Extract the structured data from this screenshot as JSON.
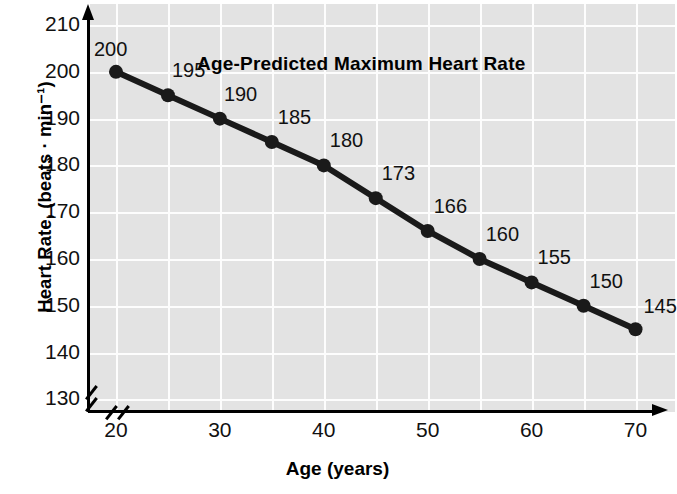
{
  "chart_data": {
    "type": "line",
    "title": "Age-Predicted Maximum Heart Rate",
    "xlabel": "Age (years)",
    "ylabel": "Heart Rate, (beats · min⁻¹)",
    "x": [
      20,
      25,
      30,
      35,
      40,
      45,
      50,
      55,
      60,
      65,
      70
    ],
    "values": [
      200,
      195,
      190,
      185,
      180,
      173,
      166,
      160,
      155,
      150,
      145
    ],
    "point_labels": [
      "200",
      "195",
      "190",
      "185",
      "180",
      "173",
      "166",
      "160",
      "155",
      "150",
      "145"
    ],
    "xlim": [
      17.5,
      73.8
    ],
    "ylim": [
      127.3,
      214.5
    ],
    "xticks": [
      20,
      30,
      40,
      50,
      60,
      70
    ],
    "xtick_labels": [
      "20",
      "30",
      "40",
      "50",
      "60",
      "70"
    ],
    "yticks": [
      130,
      140,
      150,
      160,
      170,
      180,
      190,
      200,
      210
    ],
    "ytick_labels": [
      "130",
      "140",
      "150",
      "160",
      "170",
      "180",
      "190",
      "200",
      "210"
    ],
    "grid": true,
    "grid_color": "#fdfdfd",
    "plot_background": "#e3e3e3",
    "series_color": "#1a1a1a",
    "marker": "circle",
    "legend": null,
    "axis_break_x": true,
    "axis_break_y": true
  }
}
